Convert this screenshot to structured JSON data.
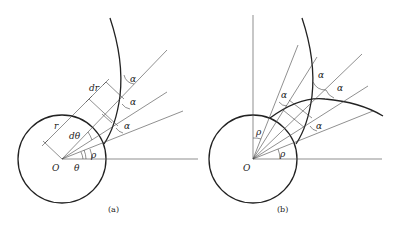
{
  "figure": {
    "panels": [
      {
        "id": "a",
        "caption": "(a)",
        "labels": {
          "origin": "O",
          "theta": "θ",
          "rho": "ρ",
          "dtheta": "dθ",
          "r": "r",
          "dr": "dr",
          "alpha_1": "α",
          "alpha_2": "α",
          "alpha_3": "α"
        }
      },
      {
        "id": "b",
        "caption": "(b)",
        "labels": {
          "origin": "O",
          "rho_upper": "ρ",
          "rho_lower": "ρ",
          "alpha_1": "α",
          "alpha_2": "α",
          "alpha_3": "α",
          "alpha_4": "α"
        }
      }
    ]
  }
}
